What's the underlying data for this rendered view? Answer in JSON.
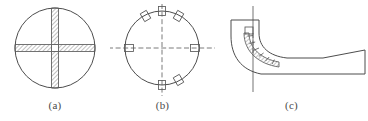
{
  "figure": {
    "background_color": "#ffffff",
    "line_color": "#4d4d4d",
    "hatch_color": "#5a5a5a",
    "centerline_color": "#6b6b6b",
    "caption_color": "#4a4a4a",
    "panels": [
      {
        "key": "a",
        "caption": "(a)",
        "kind": "circular-section-with-cross-rib",
        "description": "Circle with a hatched vertical band and hatched horizontal band forming a cross",
        "circle": {
          "cx": 55,
          "cy": 48,
          "r": 40
        },
        "vertical_band": {
          "x_center": 55,
          "width": 7,
          "top": 8,
          "bottom": 88
        },
        "horizontal_band": {
          "y_center": 48,
          "height": 7,
          "left": 15,
          "right": 95
        },
        "hatch_angle_deg": 45,
        "hatch_spacing_px": 3
      },
      {
        "key": "b",
        "caption": "(b)",
        "kind": "circular-plan-with-slots",
        "description": "Circle with dash-dot horizontal and vertical centerlines and six small rectangular slots on the rim",
        "circle": {
          "cx": 52,
          "cy": 48,
          "r": 37
        },
        "centerlines": {
          "horizontal": {
            "x1": -8,
            "x2": 112,
            "y": 48
          },
          "vertical": {
            "x": 52,
            "y1": 4,
            "y2": 96
          },
          "dash_pattern": "5 2.6"
        },
        "slot_count": 6,
        "slot_angles_deg": [
          0,
          60,
          120,
          180,
          240,
          300
        ],
        "slot_size": {
          "w": 9,
          "h": 7
        }
      },
      {
        "key": "c",
        "caption": "(c)",
        "kind": "elbow-profile-with-curved-vane",
        "description": "Curved elbow duct turning from vertical to horizontal with an internal hatched curved vane and a tapered outlet",
        "centerline": {
          "x": 38,
          "y1": 6,
          "y2": 92
        },
        "vane": {
          "segments": 9,
          "hatch_angle_deg": 45
        },
        "outlet": {
          "open_end_x": 150
        }
      }
    ]
  }
}
